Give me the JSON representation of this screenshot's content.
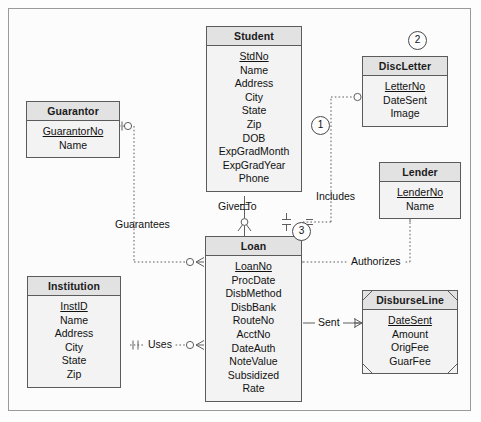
{
  "diagram": {
    "notation": "crows-foot",
    "frame_border_color": "#9a9a9a",
    "entity_header_color": "#e2e2e2",
    "entity_body_color": "#f3f3f3",
    "entity_border_color": "#5b5b5b"
  },
  "entities": [
    {
      "id": "student",
      "name": "Student",
      "weak": false,
      "attributes": [
        {
          "label": "StdNo",
          "pk": true
        },
        {
          "label": "Name",
          "pk": false
        },
        {
          "label": "Address",
          "pk": false
        },
        {
          "label": "City",
          "pk": false
        },
        {
          "label": "State",
          "pk": false
        },
        {
          "label": "Zip",
          "pk": false
        },
        {
          "label": "DOB",
          "pk": false
        },
        {
          "label": "ExpGradMonth",
          "pk": false
        },
        {
          "label": "ExpGradYear",
          "pk": false
        },
        {
          "label": "Phone",
          "pk": false
        }
      ]
    },
    {
      "id": "guarantor",
      "name": "Guarantor",
      "weak": false,
      "attributes": [
        {
          "label": "GuarantorNo",
          "pk": true
        },
        {
          "label": "Name",
          "pk": false
        }
      ]
    },
    {
      "id": "discletter",
      "name": "DiscLetter",
      "weak": false,
      "attributes": [
        {
          "label": "LetterNo",
          "pk": true
        },
        {
          "label": "DateSent",
          "pk": false
        },
        {
          "label": "Image",
          "pk": false
        }
      ]
    },
    {
      "id": "lender",
      "name": "Lender",
      "weak": false,
      "attributes": [
        {
          "label": "LenderNo",
          "pk": true
        },
        {
          "label": "Name",
          "pk": false
        }
      ]
    },
    {
      "id": "loan",
      "name": "Loan",
      "weak": false,
      "attributes": [
        {
          "label": "LoanNo",
          "pk": true
        },
        {
          "label": "ProcDate",
          "pk": false
        },
        {
          "label": "DisbMethod",
          "pk": false
        },
        {
          "label": "DisbBank",
          "pk": false
        },
        {
          "label": "RouteNo",
          "pk": false
        },
        {
          "label": "AcctNo",
          "pk": false
        },
        {
          "label": "DateAuth",
          "pk": false
        },
        {
          "label": "NoteValue",
          "pk": false
        },
        {
          "label": "Subsidized",
          "pk": false
        },
        {
          "label": "Rate",
          "pk": false
        }
      ]
    },
    {
      "id": "institution",
      "name": "Institution",
      "weak": false,
      "attributes": [
        {
          "label": "InstID",
          "pk": true
        },
        {
          "label": "Name",
          "pk": false
        },
        {
          "label": "Address",
          "pk": false
        },
        {
          "label": "City",
          "pk": false
        },
        {
          "label": "State",
          "pk": false
        },
        {
          "label": "Zip",
          "pk": false
        }
      ]
    },
    {
      "id": "disburseline",
      "name": "DisburseLine",
      "weak": true,
      "attributes": [
        {
          "label": "DateSent",
          "pk": true
        },
        {
          "label": "Amount",
          "pk": false
        },
        {
          "label": "OrigFee",
          "pk": false
        },
        {
          "label": "GuarFee",
          "pk": false
        }
      ]
    }
  ],
  "relationships": [
    {
      "id": "guarantees",
      "label": "Guarantees",
      "from": "guarantor",
      "to": "loan",
      "style": "dotted"
    },
    {
      "id": "includes",
      "label": "Includes",
      "from": "student",
      "to": "discletter",
      "style": "dotted"
    },
    {
      "id": "givento",
      "label": "GivenTo",
      "from": "student",
      "to": "loan",
      "style": "solid"
    },
    {
      "id": "authorizes",
      "label": "Authorizes",
      "from": "loan",
      "to": "lender",
      "style": "dotted"
    },
    {
      "id": "sent",
      "label": "Sent",
      "from": "loan",
      "to": "disburseline",
      "style": "solid"
    },
    {
      "id": "uses",
      "label": "Uses",
      "from": "institution",
      "to": "loan",
      "style": "dotted"
    }
  ],
  "annotations": [
    {
      "id": "note-1",
      "label": "1"
    },
    {
      "id": "note-2",
      "label": "2"
    },
    {
      "id": "note-3",
      "label": "3"
    }
  ]
}
